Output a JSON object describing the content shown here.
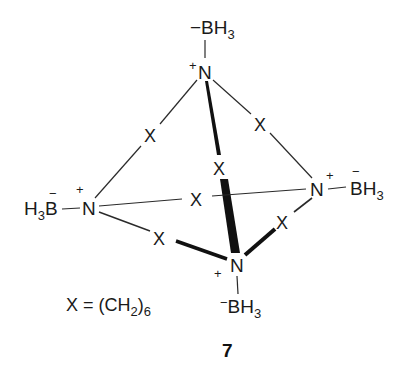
{
  "figure": {
    "type": "chemical-structure"
  },
  "atoms": {
    "top_n": {
      "symbol": "N",
      "charge": "+"
    },
    "top_b": {
      "prefix_charge": "−",
      "symbol": "BH",
      "subscript": "3"
    },
    "left_n": {
      "symbol": "N",
      "charge": "+"
    },
    "left_b": {
      "h": "H",
      "h_subscript": "3",
      "symbol": "B",
      "charge": "−"
    },
    "right_n": {
      "symbol": "N",
      "charge": "+"
    },
    "right_b": {
      "symbol": "BH",
      "subscript": "3",
      "charge": "−"
    },
    "bottom_n": {
      "symbol": "N",
      "charge": "+"
    },
    "bottom_b": {
      "prefix_charge": "−",
      "symbol": "BH",
      "subscript": "3"
    }
  },
  "bridge_labels": {
    "top_left": "X",
    "top_right": "X",
    "top_bottom": "X",
    "left_right": "X",
    "left_bottom": "X",
    "right_bottom": "X"
  },
  "legend": {
    "lhs": "X = (CH",
    "sub1": "2",
    "close": ")",
    "sub2": "6"
  },
  "compound_number": "7",
  "colors": {
    "ink": "#1a1a1a",
    "background": "#ffffff"
  }
}
